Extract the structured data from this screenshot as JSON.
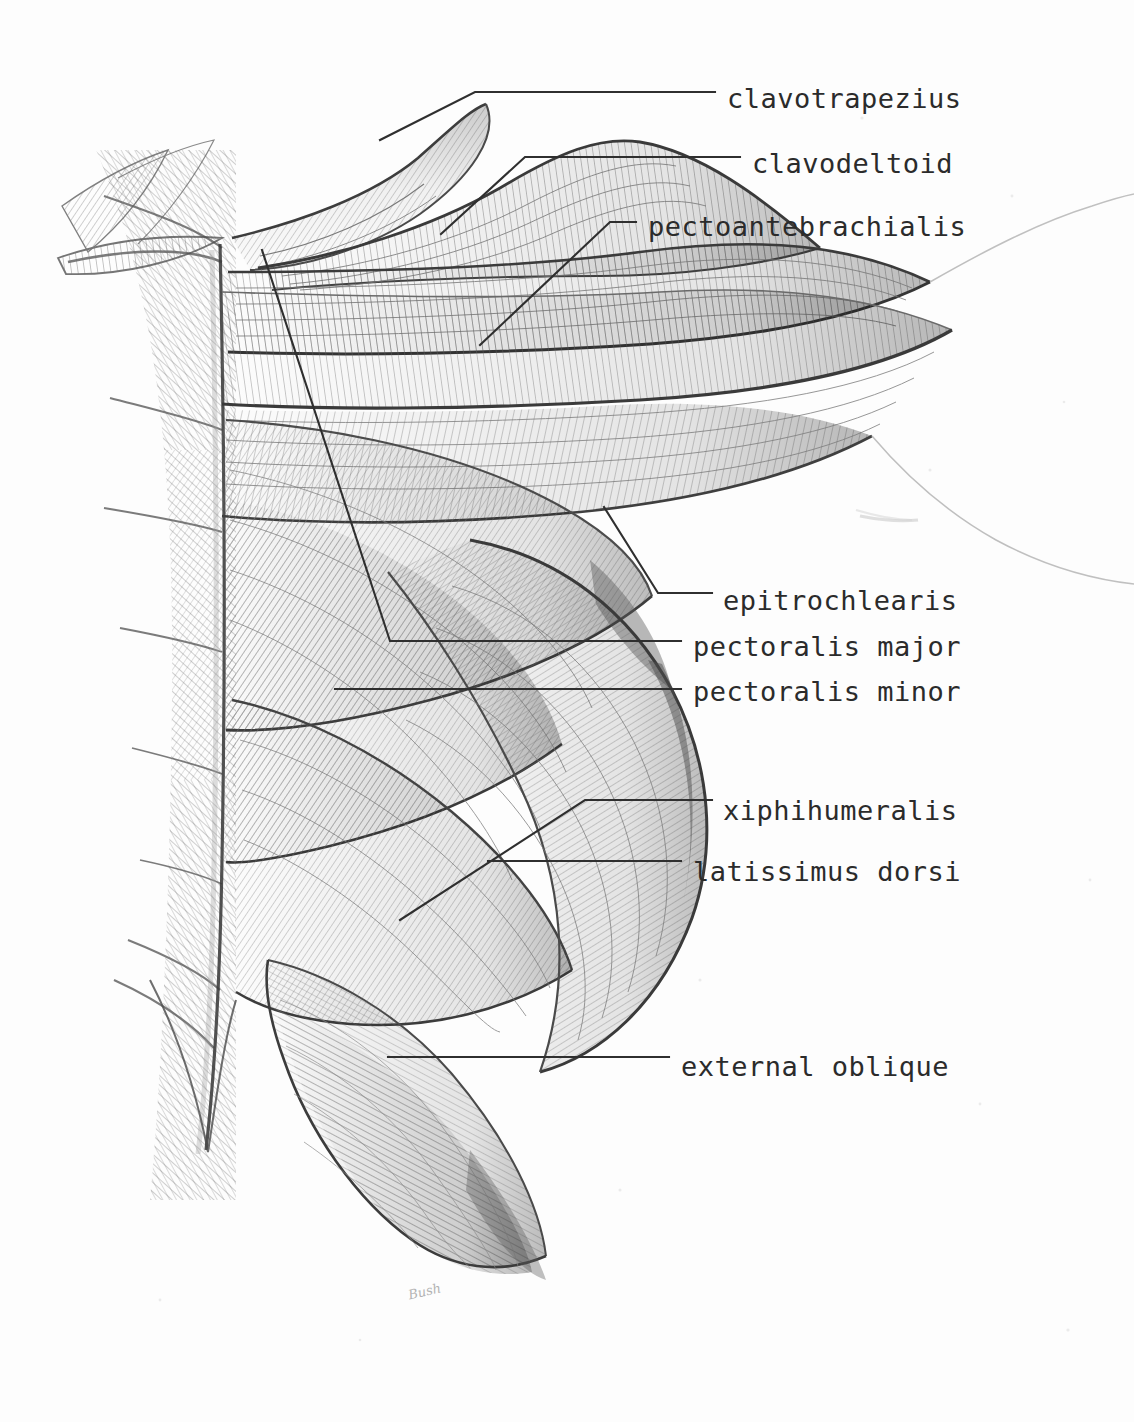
{
  "plate": {
    "title": "Superficial muscles of the cat thorax",
    "medium": "graphite pencil drawing",
    "background_color": "#fdfdfd",
    "ink_color": "#2b2b2b",
    "signature": "Bush"
  },
  "labels": [
    {
      "id": "clavotrapezius",
      "text": "clavotrapezius",
      "x": 727,
      "y": 107
    },
    {
      "id": "clavodeltoid",
      "text": "clavodeltoid",
      "x": 752,
      "y": 172
    },
    {
      "id": "pectoantebrachialis",
      "text": "pectoantebrachialis",
      "x": 648,
      "y": 235
    },
    {
      "id": "epitrochlearis",
      "text": "epitrochlearis",
      "x": 723,
      "y": 609
    },
    {
      "id": "pectoralis-major",
      "text": "pectoralis major",
      "x": 693,
      "y": 655
    },
    {
      "id": "pectoralis-minor",
      "text": "pectoralis minor",
      "x": 693,
      "y": 700
    },
    {
      "id": "xiphihumeralis",
      "text": "xiphihumeralis",
      "x": 723,
      "y": 819
    },
    {
      "id": "latissimus-dorsi",
      "text": "latissimus dorsi",
      "x": 693,
      "y": 880
    },
    {
      "id": "external-oblique",
      "text": "external oblique",
      "x": 681,
      "y": 1075
    }
  ],
  "leaders": [
    {
      "id": "clavotrapezius",
      "points": "380,140 475,92 715,92"
    },
    {
      "id": "clavodeltoid",
      "points": "441,234 525,157 740,157"
    },
    {
      "id": "pectoantebrachialis",
      "points": "480,345 610,222 636,222"
    },
    {
      "id": "epitrochlearis",
      "points": "604,507 658,593 712,593"
    },
    {
      "id": "pectoralis-major",
      "points": "262,250 390,641 681,641"
    },
    {
      "id": "pectoralis-minor",
      "points": "335,689 681,689"
    },
    {
      "id": "xiphihumeralis",
      "points": "400,920 585,800 712,800"
    },
    {
      "id": "latissimus-dorsi",
      "points": "488,861 681,861"
    },
    {
      "id": "external-oblique",
      "points": "388,1057 669,1057"
    }
  ],
  "anatomy_regions": [
    {
      "id": "midline-sternum",
      "name": "midline / sternum"
    },
    {
      "id": "clavotrapezius-belly",
      "name": "clavotrapezius belly"
    },
    {
      "id": "clavodeltoid-belly",
      "name": "clavodeltoid belly"
    },
    {
      "id": "pectoantebrachialis-band",
      "name": "pectoantebrachialis band"
    },
    {
      "id": "pectoralis-major-sheet",
      "name": "pectoralis major sheet"
    },
    {
      "id": "pectoralis-minor-sheet",
      "name": "pectoralis minor sheet"
    },
    {
      "id": "xiphihumeralis-strap",
      "name": "xiphihumeralis strap"
    },
    {
      "id": "latissimus-dorsi-sheet",
      "name": "latissimus dorsi sheet"
    },
    {
      "id": "external-oblique-sheet",
      "name": "external oblique sheet"
    },
    {
      "id": "forelimb-outline",
      "name": "forelimb outline"
    }
  ]
}
